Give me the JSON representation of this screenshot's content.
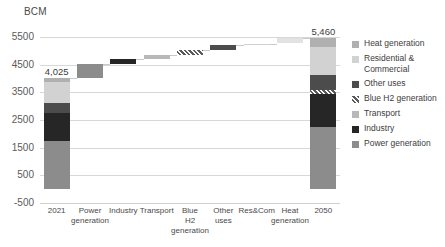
{
  "unit_label": "BCM",
  "axis": {
    "ylabel": "BCM",
    "yticks": [
      5500,
      4500,
      3500,
      2500,
      1500,
      500,
      -500
    ],
    "ytick_labels": [
      "5500",
      "4500",
      "3500",
      "2500",
      "1500",
      "500",
      "-500"
    ],
    "ymin": -500,
    "ymax": 5500,
    "grid": true
  },
  "legend": {
    "position": "right",
    "items": [
      {
        "label": "Heat generation",
        "color": "#b0b0b0",
        "pattern": "solid"
      },
      {
        "label": "Residential & Commercial",
        "color": "#d2d2d2",
        "pattern": "solid"
      },
      {
        "label": "Other uses",
        "color": "#4c4c4c",
        "pattern": "solid"
      },
      {
        "label": "Blue H2 generation",
        "color": "#d8d8d8",
        "pattern": "hatched"
      },
      {
        "label": "Transport",
        "color": "#b8b8b8",
        "pattern": "solid"
      },
      {
        "label": "Industry",
        "color": "#262626",
        "pattern": "solid"
      },
      {
        "label": "Power generation",
        "color": "#8c8c8c",
        "pattern": "solid"
      }
    ]
  },
  "chart_data": {
    "type": "bar",
    "subtype": "waterfall",
    "title": "",
    "xlabel": "",
    "ylabel": "BCM",
    "ylim": [
      -500,
      5500
    ],
    "grid": true,
    "categories": [
      "2021",
      "Power generation",
      "Industry",
      "Transport",
      "Blue H2 generation",
      "Other uses",
      "Res&Com",
      "Heat generation",
      "2050"
    ],
    "values": [
      4025,
      505,
      175,
      150,
      160,
      180,
      70,
      195,
      5460
    ],
    "data_labels": {
      "2021": "4,025",
      "2050": "5,460"
    },
    "bars": [
      {
        "name": "2021",
        "kind": "total",
        "start": 0,
        "end": 4025,
        "label": "4,025",
        "stack": [
          {
            "name": "Power generation",
            "value": 1750,
            "color": "#8c8c8c",
            "pattern": "solid"
          },
          {
            "name": "Industry",
            "value": 1000,
            "color": "#262626",
            "pattern": "solid"
          },
          {
            "name": "Transport",
            "value": 375,
            "color": "#4c4c4c",
            "pattern": "solid"
          },
          {
            "name": "Residential & Commercial",
            "value": 750,
            "color": "#d2d2d2",
            "pattern": "solid"
          },
          {
            "name": "Heat generation",
            "value": 150,
            "color": "#b0b0b0",
            "pattern": "solid"
          }
        ]
      },
      {
        "name": "Power generation",
        "kind": "delta",
        "start": 4025,
        "end": 4530,
        "value": 505,
        "color": "#8c8c8c",
        "pattern": "solid"
      },
      {
        "name": "Industry",
        "kind": "delta",
        "start": 4530,
        "end": 4705,
        "value": 175,
        "color": "#262626",
        "pattern": "solid"
      },
      {
        "name": "Transport",
        "kind": "delta",
        "start": 4705,
        "end": 4855,
        "value": 150,
        "color": "#b8b8b8",
        "pattern": "solid"
      },
      {
        "name": "Blue H2 generation",
        "kind": "delta",
        "start": 4855,
        "end": 5015,
        "value": 160,
        "color": "#d8d8d8",
        "pattern": "hatched"
      },
      {
        "name": "Other uses",
        "kind": "delta",
        "start": 5015,
        "end": 5195,
        "value": 180,
        "color": "#4c4c4c",
        "pattern": "solid"
      },
      {
        "name": "Res&Com",
        "kind": "delta",
        "start": 5195,
        "end": 5265,
        "value": 70,
        "color": "#d2d2d2",
        "pattern": "solid"
      },
      {
        "name": "Heat generation",
        "kind": "delta",
        "start": 5265,
        "end": 5460,
        "value": 195,
        "color": "#e2e2e2",
        "pattern": "solid"
      },
      {
        "name": "2050",
        "kind": "total",
        "start": 0,
        "end": 5460,
        "label": "5,460",
        "stack": [
          {
            "name": "Power generation",
            "value": 2250,
            "color": "#8c8c8c",
            "pattern": "solid"
          },
          {
            "name": "Industry",
            "value": 1175,
            "color": "#262626",
            "pattern": "solid"
          },
          {
            "name": "Blue H2 generation",
            "value": 160,
            "color": "#d8d8d8",
            "pattern": "hatched"
          },
          {
            "name": "Other uses",
            "value": 555,
            "color": "#4c4c4c",
            "pattern": "solid"
          },
          {
            "name": "Residential & Commercial",
            "value": 1000,
            "color": "#d2d2d2",
            "pattern": "solid"
          },
          {
            "name": "Heat generation",
            "value": 320,
            "color": "#b0b0b0",
            "pattern": "solid"
          }
        ]
      }
    ]
  }
}
